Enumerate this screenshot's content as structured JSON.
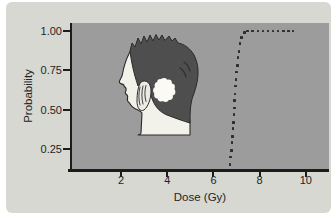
{
  "figure": {
    "kind": "textbook-figure",
    "colors": {
      "page_bg": "#ffffff",
      "panel_bg": "#d6d8d1",
      "plot_bg": "#9c9c9c",
      "axis": "#1c1c1c",
      "text": "#242424",
      "dot": "#2e2e2e",
      "hair": "#4e4e4e",
      "skin": "#f2f1ea",
      "target_blob": "#fbfaf4",
      "outline": "#2b2b2b"
    }
  },
  "chart_data": {
    "type": "scatter",
    "title": "",
    "xlabel": "Dose (Gy)",
    "ylabel": "Probability",
    "grid": false,
    "legend": null,
    "xlim": [
      -0.12,
      11.0
    ],
    "ylim": [
      0.123,
      1.051
    ],
    "x_ticks": [
      {
        "v": 2,
        "label": "2"
      },
      {
        "v": 4,
        "label": "4"
      },
      {
        "v": 6,
        "label": "6"
      },
      {
        "v": 8,
        "label": "8"
      },
      {
        "v": 10,
        "label": "10"
      }
    ],
    "y_ticks": [
      {
        "v": 0.25,
        "label": "0.25"
      },
      {
        "v": 0.5,
        "label": "0.50"
      },
      {
        "v": 0.75,
        "label": "0.75"
      },
      {
        "v": 1.0,
        "label": "1.00"
      }
    ],
    "series": [
      {
        "name": "dose-response-probability",
        "marker": "square-dot",
        "color": "#2e2e2e",
        "points": [
          [
            6.72,
            0.15
          ],
          [
            6.75,
            0.2
          ],
          [
            6.78,
            0.24
          ],
          [
            6.8,
            0.29
          ],
          [
            6.83,
            0.33
          ],
          [
            6.85,
            0.38
          ],
          [
            6.87,
            0.42
          ],
          [
            6.89,
            0.47
          ],
          [
            6.9,
            0.51
          ],
          [
            6.92,
            0.56
          ],
          [
            6.94,
            0.6
          ],
          [
            6.96,
            0.65
          ],
          [
            6.98,
            0.69
          ],
          [
            7.01,
            0.74
          ],
          [
            7.03,
            0.78
          ],
          [
            7.06,
            0.83
          ],
          [
            7.1,
            0.87
          ],
          [
            7.15,
            0.92
          ],
          [
            7.22,
            0.96
          ],
          [
            7.34,
            0.99
          ],
          [
            7.48,
            1.0
          ],
          [
            7.7,
            1.0
          ],
          [
            7.92,
            1.0
          ],
          [
            8.14,
            1.0
          ],
          [
            8.36,
            1.0
          ],
          [
            8.58,
            1.0
          ],
          [
            8.8,
            1.0
          ],
          [
            9.02,
            1.0
          ],
          [
            9.24,
            1.0
          ],
          [
            9.44,
            1.0
          ]
        ]
      }
    ],
    "inset_illustration": "human-head-profile-with-white-target-region-behind-ear"
  }
}
